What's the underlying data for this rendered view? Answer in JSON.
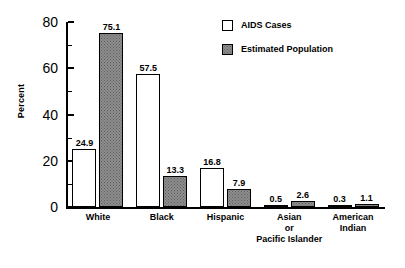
{
  "chart_data": {
    "type": "bar",
    "title": "",
    "xlabel": "",
    "ylabel": "Percent",
    "ylim": [
      0,
      80
    ],
    "y_ticks": [
      0,
      20,
      40,
      60,
      80
    ],
    "y_minor_ticks": [
      10,
      30,
      50,
      70
    ],
    "grid": false,
    "legend_position": "top-right",
    "categories": [
      "White",
      "Black",
      "Hispanic",
      "Asian or Pacific Islander",
      "American Indian"
    ],
    "category_lines": [
      [
        "White"
      ],
      [
        "Black"
      ],
      [
        "Hispanic"
      ],
      [
        "Asian",
        "or",
        "Pacific Islander"
      ],
      [
        "American",
        "Indian"
      ]
    ],
    "series": [
      {
        "name": "AIDS Cases",
        "values": [
          24.9,
          57.5,
          16.8,
          0.5,
          0.3
        ],
        "labels": [
          "24.9",
          "57.5",
          "16.8",
          "0.5",
          "0.3"
        ],
        "color": "#ffffff",
        "style": "hollow"
      },
      {
        "name": "Estimated Population",
        "values": [
          75.1,
          13.3,
          7.9,
          2.6,
          1.1
        ],
        "labels": [
          "75.1",
          "13.3",
          "7.9",
          "2.6",
          "1.1"
        ],
        "color": "#8e8e8e",
        "style": "stippled"
      }
    ]
  },
  "axis": {
    "y_tick_labels": [
      "0",
      "20",
      "40",
      "60",
      "80"
    ]
  },
  "legend": {
    "items": [
      {
        "label": "AIDS Cases"
      },
      {
        "label": "Estimated Population"
      }
    ]
  }
}
